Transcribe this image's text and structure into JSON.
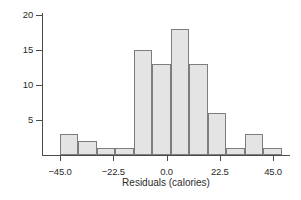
{
  "chart_data": {
    "type": "bar",
    "title": "",
    "subtitle": "",
    "xlabel": "Residuals (calories)",
    "ylabel": "",
    "grid": false,
    "legend": null,
    "xlim": [
      -48.0,
      50.0
    ],
    "ylim": [
      0,
      21
    ],
    "xticks": [
      -45.0,
      -22.5,
      0.0,
      22.5,
      45.0
    ],
    "xtick_labels": [
      "−45.0",
      "−22.5",
      "0.0",
      "22.5",
      "45.0"
    ],
    "yticks": [
      5,
      10,
      15,
      20
    ],
    "ytick_labels": [
      "5",
      "10",
      "15",
      "20"
    ],
    "bin_width": 7.8,
    "bin_edges": [
      -45.0,
      -37.2,
      -29.4,
      -21.6,
      -13.8,
      -6.0,
      1.8,
      9.6,
      17.4,
      25.2,
      33.0,
      40.8,
      48.6
    ],
    "bin_centers": [
      -41.1,
      -33.3,
      -25.5,
      -17.7,
      -9.9,
      -2.1,
      5.7,
      13.5,
      21.3,
      29.1,
      36.9,
      44.7
    ],
    "values": [
      3,
      2,
      1,
      1,
      15,
      13,
      18,
      13,
      6,
      1,
      3,
      1
    ],
    "bar_fill_color": "#e4e4e4",
    "bar_edge_color": "#7d7d7d",
    "axis_color": "#4b4b4b",
    "background_color": "#ffffff"
  }
}
